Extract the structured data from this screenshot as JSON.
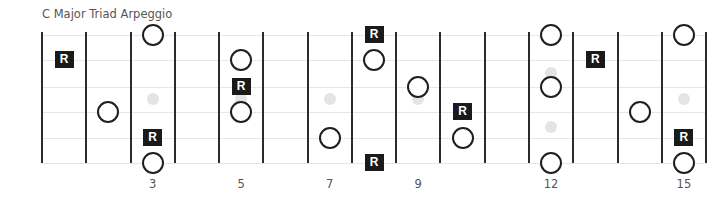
{
  "title": "C Major Triad Arpeggio",
  "colors": {
    "fret_line": "#2b2b2b",
    "string_line": "#e6e6e6",
    "inlay": "#e4e4e4",
    "root_box": "#1a1a1a",
    "circle_stroke": "#1f1f1f",
    "label_text": "#555555"
  },
  "fretboard": {
    "string_count": 6,
    "fret_count": 15,
    "root_label": "R",
    "fret_labels": [
      {
        "fret": 3,
        "label": "3"
      },
      {
        "fret": 5,
        "label": "5"
      },
      {
        "fret": 7,
        "label": "7"
      },
      {
        "fret": 9,
        "label": "9"
      },
      {
        "fret": 12,
        "label": "12"
      },
      {
        "fret": 15,
        "label": "15"
      }
    ],
    "inlays": [
      {
        "fret": 3,
        "pos": "single"
      },
      {
        "fret": 5,
        "pos": "single"
      },
      {
        "fret": 7,
        "pos": "single"
      },
      {
        "fret": 9,
        "pos": "single"
      },
      {
        "fret": 12,
        "pos": "double"
      },
      {
        "fret": 15,
        "pos": "single"
      }
    ],
    "notes": [
      {
        "fret": 1,
        "string": 2,
        "type": "root"
      },
      {
        "fret": 2,
        "string": 4,
        "type": "tone"
      },
      {
        "fret": 3,
        "string": 1,
        "type": "tone"
      },
      {
        "fret": 3,
        "string": 5,
        "type": "root"
      },
      {
        "fret": 3,
        "string": 6,
        "type": "tone"
      },
      {
        "fret": 5,
        "string": 2,
        "type": "tone"
      },
      {
        "fret": 5,
        "string": 3,
        "type": "root"
      },
      {
        "fret": 5,
        "string": 4,
        "type": "tone"
      },
      {
        "fret": 7,
        "string": 5,
        "type": "tone"
      },
      {
        "fret": 8,
        "string": 1,
        "type": "root"
      },
      {
        "fret": 8,
        "string": 2,
        "type": "tone"
      },
      {
        "fret": 8,
        "string": 6,
        "type": "root"
      },
      {
        "fret": 9,
        "string": 3,
        "type": "tone"
      },
      {
        "fret": 10,
        "string": 4,
        "type": "root"
      },
      {
        "fret": 10,
        "string": 5,
        "type": "tone"
      },
      {
        "fret": 12,
        "string": 1,
        "type": "tone"
      },
      {
        "fret": 12,
        "string": 3,
        "type": "tone"
      },
      {
        "fret": 12,
        "string": 6,
        "type": "tone"
      },
      {
        "fret": 13,
        "string": 2,
        "type": "root"
      },
      {
        "fret": 14,
        "string": 4,
        "type": "tone"
      },
      {
        "fret": 15,
        "string": 1,
        "type": "tone"
      },
      {
        "fret": 15,
        "string": 5,
        "type": "root"
      },
      {
        "fret": 15,
        "string": 6,
        "type": "tone"
      }
    ]
  }
}
